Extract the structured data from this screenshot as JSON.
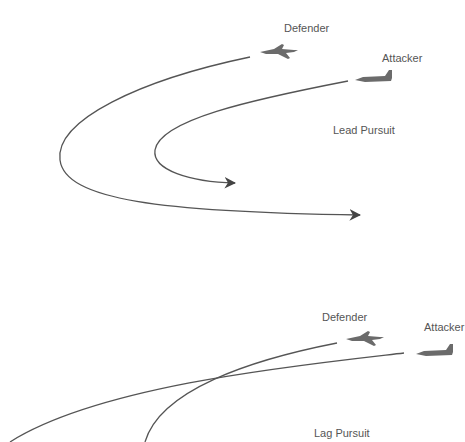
{
  "diagram": {
    "colors": {
      "line": "#555555",
      "text": "#555555",
      "aircraft": "#6b6b6b",
      "background": "#ffffff"
    },
    "panels": [
      {
        "id": "lead",
        "title": "Lead Pursuit",
        "defender_label": "Defender",
        "attacker_label": "Attacker"
      },
      {
        "id": "lag",
        "title": "Lag Pursuit",
        "defender_label": "Defender",
        "attacker_label": "Attacker"
      }
    ]
  }
}
